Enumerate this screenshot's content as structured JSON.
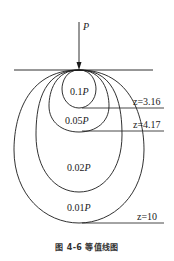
{
  "diagram": {
    "load": {
      "label": "P"
    },
    "contours": [
      {
        "label": "0.1P",
        "value": "0.1",
        "depth_label": "z=3.16"
      },
      {
        "label": "0.05P",
        "value": "0.05",
        "depth_label": "z=4.17"
      },
      {
        "label": "0.02P",
        "value": "0.02",
        "depth_label": ""
      },
      {
        "label": "0.01P",
        "value": "0.01",
        "depth_label": "z=10"
      }
    ],
    "depth_markers": [
      "z=3.16",
      "z=4.17",
      "z=10"
    ],
    "caption": "图 4-6   等值线图",
    "colors": {
      "stroke": "#1a1a1a",
      "background": "#ffffff"
    }
  }
}
